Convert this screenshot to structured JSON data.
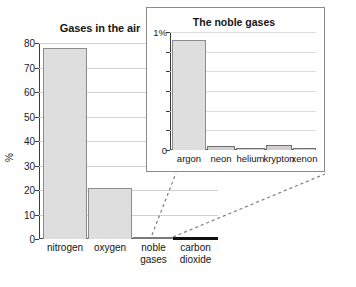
{
  "chart_data": [
    {
      "id": "main",
      "type": "bar",
      "title": "Gases in the air",
      "xlabel": "",
      "ylabel": "%",
      "categories": [
        "nitrogen",
        "oxygen",
        "noble gases",
        "carbon dioxide"
      ],
      "values": [
        78,
        21,
        0.9,
        0.04
      ],
      "ylim": [
        0,
        80
      ],
      "yticks": [
        0,
        10,
        20,
        30,
        40,
        50,
        60,
        70,
        80
      ],
      "ytick_labels": [
        "0",
        "10",
        "20",
        "30",
        "40",
        "50",
        "60",
        "70",
        "80"
      ],
      "grid": true,
      "legend": "none"
    },
    {
      "id": "inset",
      "type": "bar",
      "title": "The noble gases",
      "xlabel": "",
      "ylabel": "1%",
      "categories": [
        "argon",
        "neon",
        "helium",
        "krypton",
        "xenon"
      ],
      "values": [
        0.93,
        0.035,
        0.02,
        0.04,
        0.015
      ],
      "ylim": [
        0,
        1
      ],
      "yticks": [
        0,
        0.1667,
        0.3333,
        0.5,
        0.6667,
        0.8333,
        1
      ],
      "ytick_labels": [
        "0",
        "",
        "",
        "",
        "",
        "",
        "1%"
      ],
      "grid": true,
      "legend": "none"
    }
  ],
  "main_chart": {
    "title": "Gases in the air",
    "y_axis_label": "%",
    "y_tick_labels": [
      "80",
      "70",
      "60",
      "50",
      "40",
      "30",
      "20",
      "10",
      "0"
    ],
    "categories": [
      {
        "label_line1": "nitrogen",
        "label_line2": ""
      },
      {
        "label_line1": "oxygen",
        "label_line2": ""
      },
      {
        "label_line1": "noble",
        "label_line2": "gases"
      },
      {
        "label_line1": "carbon",
        "label_line2": "dioxide"
      }
    ]
  },
  "inset_chart": {
    "title": "The noble gases",
    "y_top_label": "1%",
    "y_zero_label": "0",
    "categories": [
      "argon",
      "neon",
      "helium",
      "krypton",
      "xenon"
    ]
  },
  "colors": {
    "bar_fill": "#dedede",
    "bar_stroke": "#8c8c8c",
    "gridline": "#d2d2d2",
    "axis": "#3b3b3b",
    "text": "#141414",
    "baseline_highlight": "#111111",
    "connector": "#777777",
    "panel_border": "#8a8a8a"
  }
}
